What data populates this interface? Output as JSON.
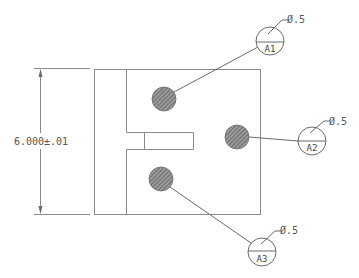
{
  "drawing": {
    "dimension": {
      "label": "6.000±.01"
    },
    "callouts": [
      {
        "id": "A1",
        "label": "A1",
        "diameter": "Ø.5"
      },
      {
        "id": "A2",
        "label": "A2",
        "diameter": "Ø.5"
      },
      {
        "id": "A3",
        "label": "A3",
        "diameter": "Ø.5"
      }
    ],
    "colors": {
      "line": "#8a8a8a",
      "hole_fill": "#7a7a7a",
      "text": "#555555"
    }
  }
}
